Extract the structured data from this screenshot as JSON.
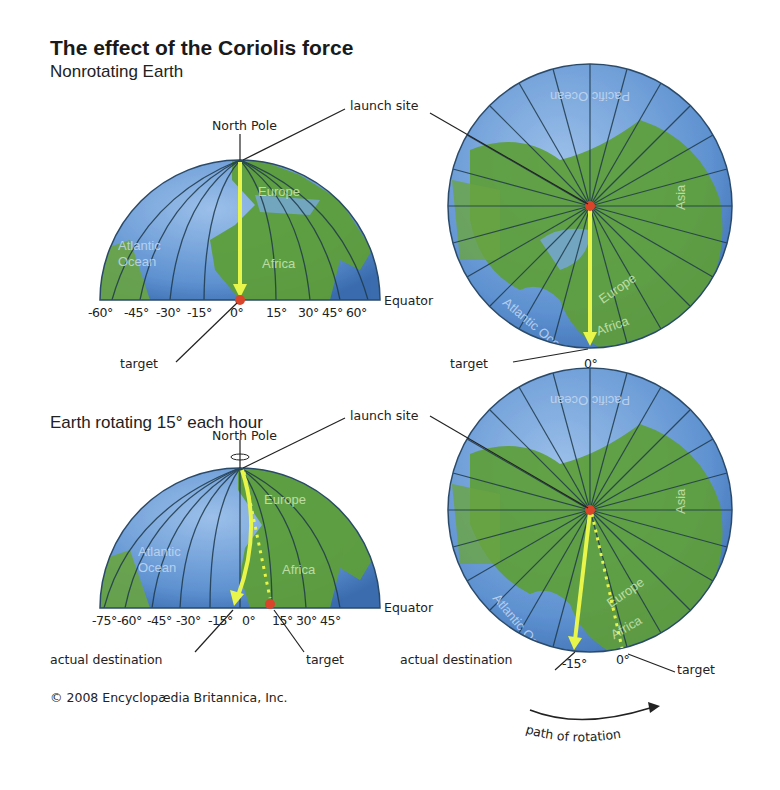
{
  "title": "The effect of the Coriolis force",
  "panels": {
    "top": {
      "subtitle": "Nonrotating Earth",
      "north_pole_label": "North Pole",
      "launch_site_label": "launch site",
      "equator_label": "Equator",
      "target_label": "target",
      "longitudes": [
        "-60°",
        "-45°",
        "-30°",
        "-15°",
        "0°",
        "15°",
        "30°",
        "45°",
        "60°"
      ],
      "polar_view_zero_label": "0°",
      "polar_target_label": "target",
      "regions": [
        "Europe",
        "Africa",
        "Atlantic Ocean",
        "Pacific Ocean",
        "Asia"
      ]
    },
    "bottom": {
      "subtitle": "Earth rotating 15° each hour",
      "north_pole_label": "North Pole",
      "launch_site_label": "launch site",
      "equator_label": "Equator",
      "actual_destination_label": "actual destination",
      "target_label": "target",
      "longitudes": [
        "-75°",
        "-60°",
        "-45°",
        "-30°",
        "-15°",
        "0°",
        "15°",
        "30°",
        "45°"
      ],
      "polar_actual_destination_label": "actual destination",
      "polar_target_label": "target",
      "polar_minus15_label": "-15°",
      "polar_zero_label": "0°",
      "path_of_rotation_label": "path of rotation",
      "regions": [
        "Europe",
        "Africa",
        "Atlantic Ocean",
        "Pacific Ocean",
        "Asia"
      ]
    }
  },
  "colors": {
    "ocean": "#5b8fd0",
    "land": "#5e9e3a",
    "trajectory": "#e8f54a",
    "launch_point": "#d9452a",
    "meridian": "#1f3a4a"
  },
  "copyright": "© 2008 Encyclopædia Britannica, Inc."
}
